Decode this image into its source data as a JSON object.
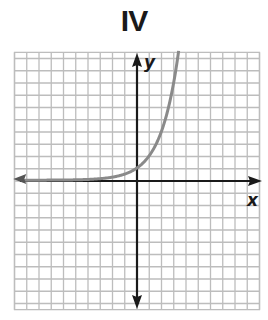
{
  "title": "IV",
  "axes": {
    "x_label": "x",
    "y_label": "y"
  },
  "colors": {
    "grid": "#bdbdbd",
    "axis": "#1a1a1a",
    "curve": "#8a8a8a"
  },
  "chart_data": {
    "type": "line",
    "title": "IV",
    "xlabel": "x",
    "ylabel": "y",
    "xlim": [
      -10,
      10
    ],
    "ylim": [
      -10.5,
      10.5
    ],
    "grid": true,
    "tick_labels": false,
    "function": "y = 2^x (exponential growth, horizontal asymptote y = 0)",
    "series": [
      {
        "name": "curve",
        "x": [
          -10,
          -8,
          -6,
          -4,
          -3,
          -2,
          -1,
          0,
          1,
          2,
          2.5,
          3,
          3.4
        ],
        "y": [
          0.001,
          0.004,
          0.016,
          0.0625,
          0.125,
          0.25,
          0.5,
          1,
          2,
          4,
          5.66,
          8,
          10.56
        ]
      }
    ],
    "annotations": [
      "left arrow on curve near asymptote",
      "arrows on both ends of x- and y-axes"
    ]
  }
}
